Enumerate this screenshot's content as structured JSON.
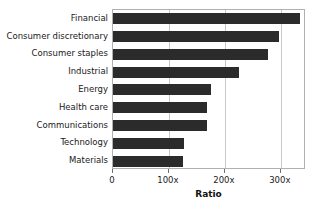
{
  "chart_data": {
    "type": "bar",
    "orientation": "horizontal",
    "title": "",
    "xlabel": "Ratio",
    "ylabel": "",
    "categories": [
      "Financial",
      "Consumer discretionary",
      "Consumer staples",
      "Industrial",
      "Energy",
      "Health care",
      "Communications",
      "Technology",
      "Materials"
    ],
    "values": [
      335,
      296,
      277,
      225,
      175,
      168,
      168,
      127,
      125
    ],
    "xlim": [
      0,
      345
    ],
    "xticks": [
      0,
      100,
      200,
      300
    ],
    "xtick_labels": [
      "0",
      "100x",
      "200x",
      "300x"
    ],
    "grid": "vertical",
    "legend": "none",
    "bar_color": "#2b2b2b",
    "grid_color": "#c9c9c9",
    "frame_color": "#b0b0b0"
  },
  "axis": {
    "x_title": "Ratio"
  }
}
